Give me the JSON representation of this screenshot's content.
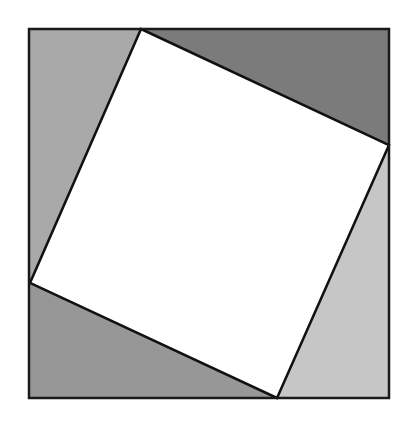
{
  "diagram": {
    "type": "pythagorean-square-proof",
    "outer_square": {
      "x1": 29,
      "y1": 29,
      "x2": 389,
      "y2": 398,
      "stroke": "#1a1a1a"
    },
    "inner_square": {
      "points": "141,29 389,145 277,398 30,283",
      "fill": "#ffffff",
      "stroke": "#111111"
    },
    "triangles": [
      {
        "name": "top-left",
        "points": "29,29 141,29 30,283 29,283",
        "fill": "#a9a9a9"
      },
      {
        "name": "top-right",
        "points": "141,29 389,29 389,145",
        "fill": "#7b7b7b"
      },
      {
        "name": "bottom-right",
        "points": "389,145 389,398 277,398",
        "fill": "#c6c6c6"
      },
      {
        "name": "bottom-left",
        "points": "30,283 277,398 29,398",
        "fill": "#979797"
      }
    ]
  }
}
